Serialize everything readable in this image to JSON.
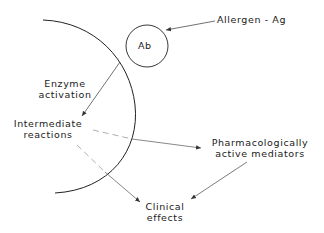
{
  "labels": {
    "ab": "Ab",
    "allergen": "Allergen - Ag",
    "enzyme_line1": "Enzyme",
    "enzyme_line2": "activation",
    "intermediate_line1": "Intermediate",
    "intermediate_line2": "reactions",
    "mediators_line1": "Pharmacologically",
    "mediators_line2": "active mediators",
    "clinical_line1": "Clinical",
    "clinical_line2": "effects"
  },
  "colors": {
    "stroke": "#222222",
    "dashed": "#888888",
    "background": "#ffffff"
  }
}
